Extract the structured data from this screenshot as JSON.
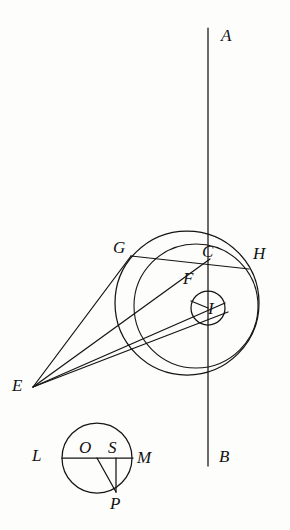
{
  "figure": {
    "background_color": "#fdfdfc",
    "stroke_color": "#141414",
    "canvas": {
      "width": 290,
      "height": 530
    }
  },
  "labels": {
    "A": "A",
    "B": "B",
    "C": "C",
    "E": "E",
    "F": "F",
    "G": "G",
    "H": "H",
    "I": "I",
    "L": "L",
    "M": "M",
    "O": "O",
    "P": "P",
    "S": "S"
  },
  "points": {
    "A": {
      "x": 208,
      "y": 28,
      "label_x": 221,
      "label_y": 27
    },
    "B": {
      "x": 208,
      "y": 466,
      "label_x": 219,
      "label_y": 448
    },
    "C": {
      "x": 209,
      "y": 262,
      "label_x": 204,
      "label_y": 244
    },
    "E": {
      "x": 33,
      "y": 387,
      "label_x": 14,
      "label_y": 378
    },
    "F": {
      "x": 197,
      "y": 291,
      "label_x": 184,
      "label_y": 270
    },
    "G": {
      "x": 131,
      "y": 256,
      "label_x": 114,
      "label_y": 240
    },
    "H": {
      "x": 249,
      "y": 269,
      "label_x": 254,
      "label_y": 245
    },
    "I": {
      "x": 208,
      "y": 308,
      "label_x": 208,
      "label_y": 299
    },
    "L": {
      "x": 62,
      "y": 458,
      "label_x": 33,
      "label_y": 448
    },
    "M": {
      "x": 132,
      "y": 458,
      "label_x": 138,
      "label_y": 450
    },
    "O": {
      "x": 97,
      "y": 458,
      "label_x": 80,
      "label_y": 440
    },
    "P": {
      "x": 116,
      "y": 492,
      "label_x": 110,
      "label_y": 496
    },
    "S": {
      "x": 116,
      "y": 458,
      "label_x": 108,
      "label_y": 440
    }
  },
  "shapes": {
    "vertical_axis": {
      "name": "line-AB",
      "x1": 208,
      "y1": 28,
      "x2": 208,
      "y2": 466
    },
    "outer_circle": {
      "name": "circle-outer",
      "cx": 187,
      "cy": 303,
      "r": 72
    },
    "inner_circle": {
      "name": "circle-inner",
      "cx": 196,
      "cy": 306,
      "r": 62
    },
    "small_circle_I": {
      "name": "circle-I",
      "cx": 208,
      "cy": 308,
      "r": 17
    },
    "bottom_circle": {
      "name": "circle-LMP",
      "cx": 97,
      "cy": 458,
      "r": 35
    },
    "chord_GH": {
      "name": "chord-G-H",
      "x1": 131,
      "y1": 256,
      "x2": 249,
      "y2": 269
    },
    "ray_EG": {
      "name": "ray-E-G",
      "x1": 33,
      "y1": 387,
      "x2": 131,
      "y2": 256
    },
    "ray_EC": {
      "name": "ray-E-C",
      "x1": 33,
      "y1": 387,
      "x2": 209,
      "y2": 262
    },
    "ray_EF": {
      "name": "ray-E-F",
      "x1": 33,
      "y1": 387,
      "x2": 214,
      "y2": 302
    },
    "ray_EI": {
      "name": "ray-E-I",
      "x1": 33,
      "y1": 387,
      "x2": 217,
      "y2": 310
    },
    "diameter_LM": {
      "name": "diameter-L-M",
      "x1": 62,
      "y1": 458,
      "x2": 133,
      "y2": 458
    },
    "segment_OP": {
      "name": "segment-O-P",
      "x1": 97,
      "y1": 458,
      "x2": 116,
      "y2": 492
    },
    "segment_SP": {
      "name": "segment-S-P",
      "x1": 116,
      "y1": 458,
      "x2": 116,
      "y2": 492
    }
  }
}
